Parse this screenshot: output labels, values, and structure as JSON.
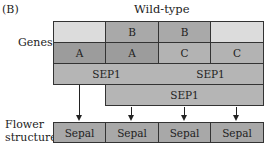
{
  "panel_label": "(B)",
  "title": "Wild-type",
  "row_labels": {
    "genes": "Genes",
    "flower_structure_line1": "Flower",
    "flower_structure_line2": "structure"
  },
  "gene_rows": {
    "b_row": [
      "",
      "B",
      "B",
      ""
    ],
    "ac_row": [
      "A",
      "A",
      "C",
      "C"
    ],
    "sep1_row1": [
      "SEP1",
      "SEP1"
    ],
    "sep1_row2": [
      "SEP1"
    ]
  },
  "flower_structure": [
    "Sepal",
    "Sepal",
    "Sepal",
    "Sepal"
  ],
  "colors": {
    "light_cell": "#dcdcdc",
    "b_cell": "#a9a9a9",
    "a_cell": "#9c9c9c",
    "c_cell": "#b3b3b3",
    "sep1_cell": "#b5b5b5",
    "sepal_cell": "#a8a8a8"
  }
}
